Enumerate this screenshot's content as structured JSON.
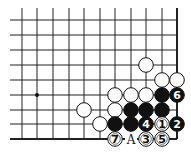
{
  "diagram": {
    "type": "go-board-fragment",
    "columns_x": [
      22,
      37,
      53,
      69,
      84,
      100,
      115,
      131,
      146,
      162,
      177
    ],
    "rows_y": [
      20,
      35,
      50,
      65,
      80,
      95,
      110,
      124,
      139
    ],
    "line_top": 8,
    "line_left": 10,
    "right_edge_col": 10,
    "bottom_edge_row": 8,
    "hoshi": [
      {
        "col": 1,
        "row": 5
      }
    ],
    "stone_radius": 7.3,
    "colors": {
      "line": "#222222",
      "black": "#111111",
      "white": "#ffffff",
      "background": "#ffffff"
    },
    "stones": [
      {
        "col": 8,
        "row": 3,
        "color": "white",
        "label": ""
      },
      {
        "col": 9,
        "row": 4,
        "color": "white",
        "label": ""
      },
      {
        "col": 10,
        "row": 4,
        "color": "white",
        "label": ""
      },
      {
        "col": 6,
        "row": 5,
        "color": "white",
        "label": ""
      },
      {
        "col": 7,
        "row": 5,
        "color": "white",
        "label": ""
      },
      {
        "col": 8,
        "row": 5,
        "color": "white",
        "label": ""
      },
      {
        "col": 9,
        "row": 5,
        "color": "black",
        "label": ""
      },
      {
        "col": 10,
        "row": 5,
        "color": "black",
        "label": "6"
      },
      {
        "col": 4,
        "row": 6,
        "color": "white",
        "label": ""
      },
      {
        "col": 6,
        "row": 6,
        "color": "white",
        "label": ""
      },
      {
        "col": 7,
        "row": 6,
        "color": "black",
        "label": ""
      },
      {
        "col": 8,
        "row": 6,
        "color": "black",
        "label": ""
      },
      {
        "col": 9,
        "row": 6,
        "color": "black",
        "label": ""
      },
      {
        "col": 5,
        "row": 7,
        "color": "white",
        "label": ""
      },
      {
        "col": 6,
        "row": 7,
        "color": "black",
        "label": ""
      },
      {
        "col": 7,
        "row": 7,
        "color": "black",
        "label": ""
      },
      {
        "col": 8,
        "row": 7,
        "color": "black",
        "label": "4"
      },
      {
        "col": 9,
        "row": 7,
        "color": "white",
        "label": "1"
      },
      {
        "col": 10,
        "row": 7,
        "color": "black",
        "label": "2"
      },
      {
        "col": 6,
        "row": 8,
        "color": "white",
        "label": "7"
      },
      {
        "col": 8,
        "row": 8,
        "color": "white",
        "label": "3"
      },
      {
        "col": 9,
        "row": 8,
        "color": "white",
        "label": "5"
      }
    ],
    "markers": [
      {
        "col": 7,
        "row": 8,
        "text": "A"
      }
    ]
  }
}
